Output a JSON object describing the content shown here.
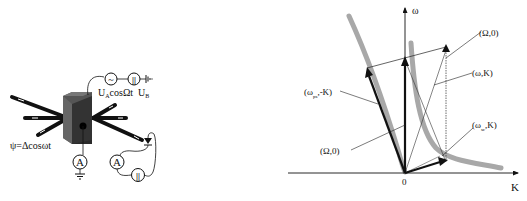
{
  "setup": {
    "ac_source_symbol": "~",
    "dc_source_symbol": "||",
    "ac_voltage_label": "U",
    "ac_voltage_sub": "A",
    "ac_voltage_expr": "cosΩt",
    "dc_voltage_label": "U",
    "dc_voltage_sub": "B",
    "ammeter_1_label": "A",
    "ammeter_2_label": "A",
    "battery_label": "||",
    "angle_label": "ψ=Δcosωt"
  },
  "dispersion": {
    "axis_y_label": "ω",
    "axis_x_label": "K",
    "origin_label": "0",
    "labels": {
      "omega0_top": "(Ω,0)",
      "omegaK": "(ω,K)",
      "omega_ps_negK": "(ω",
      "omega_ps_sub": "ps",
      "omega_ps_tail": ",-K)",
      "omega0_left": "(Ω,0)",
      "omega_sc": "(ω",
      "omega_sc_sub": "sc",
      "omega_sc_tail": ",K)"
    },
    "colors": {
      "vectors": "#111111",
      "dispersion_curve": "#a8a8a8",
      "thin_lines": "#444444"
    }
  }
}
